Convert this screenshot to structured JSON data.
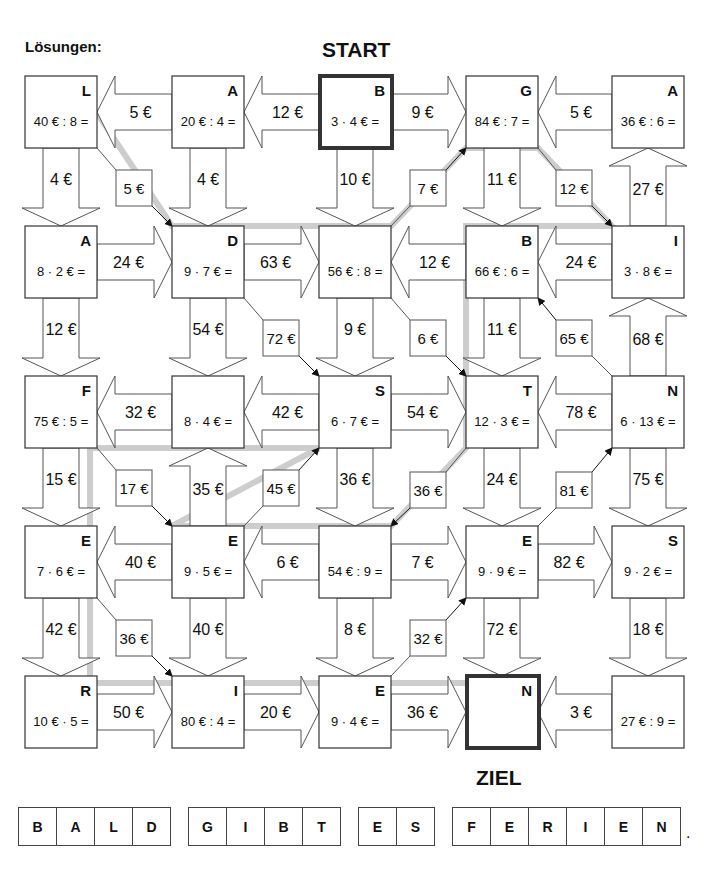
{
  "header": {
    "solutions_label": "Lösungen:",
    "start_label": "START",
    "goal_label": "ZIEL"
  },
  "colors": {
    "path_highlight": "#c8c8c8",
    "box_border": "#333333",
    "arrow_stroke": "#555555",
    "text": "#111111"
  },
  "grid": {
    "col_x": [
      25,
      172,
      319,
      466,
      612
    ],
    "row_y": [
      76,
      226,
      376,
      526,
      676
    ],
    "box_size": 72
  },
  "boxes": [
    {
      "id": "r0c0",
      "row": 0,
      "col": 0,
      "letter": "L",
      "task": "40 € : 8 ="
    },
    {
      "id": "r0c1",
      "row": 0,
      "col": 1,
      "letter": "A",
      "task": "20 € : 4 ="
    },
    {
      "id": "r0c2",
      "row": 0,
      "col": 2,
      "letter": "B",
      "task": "3 · 4 € =",
      "bold": true
    },
    {
      "id": "r0c3",
      "row": 0,
      "col": 3,
      "letter": "G",
      "task": "84 € : 7 ="
    },
    {
      "id": "r0c4",
      "row": 0,
      "col": 4,
      "letter": "A",
      "task": "36 € : 6 ="
    },
    {
      "id": "r1c0",
      "row": 1,
      "col": 0,
      "letter": "A",
      "task": "8 · 2 € ="
    },
    {
      "id": "r1c1",
      "row": 1,
      "col": 1,
      "letter": "D",
      "task": "9 · 7 € ="
    },
    {
      "id": "r1c2",
      "row": 1,
      "col": 2,
      "letter": "",
      "task": "56 € : 8 ="
    },
    {
      "id": "r1c3",
      "row": 1,
      "col": 3,
      "letter": "B",
      "task": "66 € : 6 ="
    },
    {
      "id": "r1c4",
      "row": 1,
      "col": 4,
      "letter": "I",
      "task": "3 · 8 € ="
    },
    {
      "id": "r2c0",
      "row": 2,
      "col": 0,
      "letter": "F",
      "task": "75 € : 5 ="
    },
    {
      "id": "r2c1",
      "row": 2,
      "col": 1,
      "letter": "",
      "task": "8 · 4 € ="
    },
    {
      "id": "r2c2",
      "row": 2,
      "col": 2,
      "letter": "S",
      "task": "6 · 7 € ="
    },
    {
      "id": "r2c3",
      "row": 2,
      "col": 3,
      "letter": "T",
      "task": "12 · 3 € ="
    },
    {
      "id": "r2c4",
      "row": 2,
      "col": 4,
      "letter": "N",
      "task": "6 · 13 € ="
    },
    {
      "id": "r3c0",
      "row": 3,
      "col": 0,
      "letter": "E",
      "task": "7 · 6 € ="
    },
    {
      "id": "r3c1",
      "row": 3,
      "col": 1,
      "letter": "E",
      "task": "9 · 5 € ="
    },
    {
      "id": "r3c2",
      "row": 3,
      "col": 2,
      "letter": "",
      "task": "54 € : 9 ="
    },
    {
      "id": "r3c3",
      "row": 3,
      "col": 3,
      "letter": "E",
      "task": "9 · 9 € ="
    },
    {
      "id": "r3c4",
      "row": 3,
      "col": 4,
      "letter": "S",
      "task": "9 · 2 € ="
    },
    {
      "id": "r4c0",
      "row": 4,
      "col": 0,
      "letter": "R",
      "task": "10 € · 5 ="
    },
    {
      "id": "r4c1",
      "row": 4,
      "col": 1,
      "letter": "I",
      "task": "80 € : 4 ="
    },
    {
      "id": "r4c2",
      "row": 4,
      "col": 2,
      "letter": "E",
      "task": "9 · 4 € ="
    },
    {
      "id": "r4c3",
      "row": 4,
      "col": 3,
      "letter": "N",
      "task": "",
      "bold": true
    },
    {
      "id": "r4c4",
      "row": 4,
      "col": 4,
      "letter": "",
      "task": "27 € : 9 ="
    }
  ],
  "h_arrows": [
    {
      "row": 0,
      "gap": 0,
      "dir": "left",
      "label": "5 €"
    },
    {
      "row": 0,
      "gap": 1,
      "dir": "left",
      "label": "12 €"
    },
    {
      "row": 0,
      "gap": 2,
      "dir": "right",
      "label": "9 €"
    },
    {
      "row": 0,
      "gap": 3,
      "dir": "left",
      "label": "5 €"
    },
    {
      "row": 1,
      "gap": 0,
      "dir": "right",
      "label": "24 €"
    },
    {
      "row": 1,
      "gap": 1,
      "dir": "right",
      "label": "63 €"
    },
    {
      "row": 1,
      "gap": 2,
      "dir": "left",
      "label": "12 €"
    },
    {
      "row": 1,
      "gap": 3,
      "dir": "left",
      "label": "24 €"
    },
    {
      "row": 2,
      "gap": 0,
      "dir": "left",
      "label": "32 €"
    },
    {
      "row": 2,
      "gap": 1,
      "dir": "left",
      "label": "42 €"
    },
    {
      "row": 2,
      "gap": 2,
      "dir": "right",
      "label": "54 €"
    },
    {
      "row": 2,
      "gap": 3,
      "dir": "left",
      "label": "78 €"
    },
    {
      "row": 3,
      "gap": 0,
      "dir": "left",
      "label": "40 €"
    },
    {
      "row": 3,
      "gap": 1,
      "dir": "left",
      "label": "6 €"
    },
    {
      "row": 3,
      "gap": 2,
      "dir": "right",
      "label": "7 €"
    },
    {
      "row": 3,
      "gap": 3,
      "dir": "right",
      "label": "82 €"
    },
    {
      "row": 4,
      "gap": 0,
      "dir": "right",
      "label": "50 €"
    },
    {
      "row": 4,
      "gap": 1,
      "dir": "right",
      "label": "20 €"
    },
    {
      "row": 4,
      "gap": 2,
      "dir": "right",
      "label": "36 €"
    },
    {
      "row": 4,
      "gap": 3,
      "dir": "left",
      "label": "3 €"
    }
  ],
  "v_arrows": [
    {
      "col": 0,
      "gap": 0,
      "dir": "down",
      "label": "4 €"
    },
    {
      "col": 1,
      "gap": 0,
      "dir": "down",
      "label": "4 €"
    },
    {
      "col": 2,
      "gap": 0,
      "dir": "down",
      "label": "10 €"
    },
    {
      "col": 3,
      "gap": 0,
      "dir": "down",
      "label": "11 €"
    },
    {
      "col": 4,
      "gap": 0,
      "dir": "up",
      "label": "27 €"
    },
    {
      "col": 0,
      "gap": 1,
      "dir": "down",
      "label": "12 €"
    },
    {
      "col": 1,
      "gap": 1,
      "dir": "down",
      "label": "54 €"
    },
    {
      "col": 2,
      "gap": 1,
      "dir": "down",
      "label": "9 €"
    },
    {
      "col": 3,
      "gap": 1,
      "dir": "down",
      "label": "11 €"
    },
    {
      "col": 4,
      "gap": 1,
      "dir": "up",
      "label": "68 €"
    },
    {
      "col": 0,
      "gap": 2,
      "dir": "down",
      "label": "15 €"
    },
    {
      "col": 1,
      "gap": 2,
      "dir": "up",
      "label": "35 €"
    },
    {
      "col": 2,
      "gap": 2,
      "dir": "down",
      "label": "36 €"
    },
    {
      "col": 3,
      "gap": 2,
      "dir": "down",
      "label": "24 €"
    },
    {
      "col": 4,
      "gap": 2,
      "dir": "down",
      "label": "75 €"
    },
    {
      "col": 0,
      "gap": 3,
      "dir": "down",
      "label": "42 €"
    },
    {
      "col": 1,
      "gap": 3,
      "dir": "down",
      "label": "40 €"
    },
    {
      "col": 2,
      "gap": 3,
      "dir": "down",
      "label": "8 €"
    },
    {
      "col": 3,
      "gap": 3,
      "dir": "down",
      "label": "72 €"
    },
    {
      "col": 4,
      "gap": 3,
      "dir": "down",
      "label": "18 €"
    }
  ],
  "diag_arrows": [
    {
      "from": [
        0,
        0
      ],
      "to": [
        1,
        1
      ],
      "label": "5 €",
      "lx": 116,
      "ly": 170
    },
    {
      "from": [
        1,
        2
      ],
      "to": [
        0,
        3
      ],
      "label": "7 €",
      "lx": 410,
      "ly": 170
    },
    {
      "from": [
        0,
        3
      ],
      "to": [
        1,
        4
      ],
      "label": "12 €",
      "lx": 556,
      "ly": 170
    },
    {
      "from": [
        1,
        1
      ],
      "to": [
        2,
        2
      ],
      "label": "72 €",
      "lx": 263,
      "ly": 320
    },
    {
      "from": [
        1,
        2
      ],
      "to": [
        2,
        3
      ],
      "label": "6 €",
      "lx": 410,
      "ly": 320
    },
    {
      "from": [
        2,
        4
      ],
      "to": [
        1,
        3
      ],
      "label": "65 €",
      "lx": 556,
      "ly": 320
    },
    {
      "from": [
        2,
        0
      ],
      "to": [
        3,
        1
      ],
      "label": "17 €",
      "lx": 116,
      "ly": 470
    },
    {
      "from": [
        3,
        1
      ],
      "to": [
        2,
        2
      ],
      "label": "45 €",
      "lx": 263,
      "ly": 470
    },
    {
      "from": [
        2,
        3
      ],
      "to": [
        3,
        2
      ],
      "label": "36 €",
      "lx": 410,
      "ly": 472
    },
    {
      "from": [
        3,
        3
      ],
      "to": [
        2,
        4
      ],
      "label": "81 €",
      "lx": 556,
      "ly": 472
    },
    {
      "from": [
        3,
        0
      ],
      "to": [
        4,
        1
      ],
      "label": "36 €",
      "lx": 116,
      "ly": 620
    },
    {
      "from": [
        4,
        2
      ],
      "to": [
        3,
        3
      ],
      "label": "32 €",
      "lx": 410,
      "ly": 620
    }
  ],
  "solution_path": [
    [
      392,
      113
    ],
    [
      97,
      113
    ],
    [
      172,
      226
    ],
    [
      391,
      226
    ],
    [
      466,
      148
    ],
    [
      538,
      148
    ],
    [
      612,
      226
    ],
    [
      466,
      226
    ],
    [
      466,
      448
    ],
    [
      391,
      526
    ],
    [
      172,
      526
    ],
    [
      319,
      448
    ],
    [
      90,
      448
    ],
    [
      90,
      683
    ],
    [
      466,
      683
    ]
  ],
  "answer": {
    "words": [
      [
        "B",
        "A",
        "L",
        "D"
      ],
      [
        "G",
        "I",
        "B",
        "T"
      ],
      [
        "E",
        "S"
      ],
      [
        "F",
        "E",
        "R",
        "I",
        "E",
        "N"
      ]
    ],
    "end_mark": "."
  }
}
